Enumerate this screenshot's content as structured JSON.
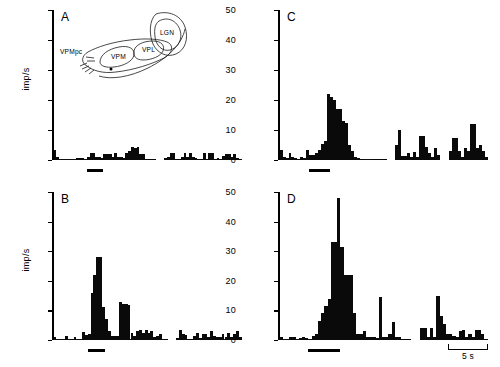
{
  "figure": {
    "axis_title": "imp/s",
    "yticks": [
      0,
      10,
      20,
      30,
      40,
      50
    ],
    "ylim": [
      0,
      50
    ],
    "scale_label": "5 s",
    "panel_labels": [
      "A",
      "B",
      "C",
      "D"
    ]
  },
  "inset": {
    "name": "thalamus-schematic",
    "labels": [
      {
        "text": "LGN"
      },
      {
        "text": "VPL"
      },
      {
        "text": "VPM"
      },
      {
        "text": "VPMpc"
      }
    ]
  },
  "chart_data": [
    {
      "type": "bar",
      "panel": "A",
      "title": "A",
      "xlabel": "",
      "ylabel": "imp/s",
      "ylim": [
        0,
        50
      ],
      "yticks": [
        0,
        10,
        20,
        30,
        40,
        50
      ],
      "bin_seconds": 0.25,
      "stimulus_bar": {
        "start_bin": 12,
        "end_bin": 18,
        "label": ""
      },
      "gaps": [
        [
          37,
          40
        ]
      ],
      "values": [
        3.2,
        1.0,
        0,
        0,
        0,
        0,
        0,
        0,
        0.7,
        0.7,
        0.6,
        0,
        1.0,
        2.2,
        2.2,
        1.0,
        1.0,
        0.7,
        2.0,
        2.0,
        2.0,
        1.0,
        2.2,
        1.0,
        1.0,
        0.6,
        2.3,
        3.0,
        4.2,
        4.0,
        4.2,
        2.0,
        2.0,
        0.5,
        0.3,
        0.3,
        0.2,
        0,
        0,
        0,
        0.6,
        1.0,
        2.3,
        2.2,
        0.4,
        0.3,
        1.0,
        2.2,
        1.0,
        2.3,
        1.0,
        0.6,
        0.5,
        0.4,
        2.5,
        0.5,
        2.4,
        2.4,
        0.5,
        0.6,
        0.5,
        1.2,
        2.0,
        2.0,
        1.0,
        2.0,
        0.6,
        0.4
      ]
    },
    {
      "type": "bar",
      "panel": "B",
      "title": "B",
      "xlabel": "",
      "ylabel": "imp/s",
      "ylim": [
        0,
        50
      ],
      "yticks": [
        0,
        10,
        20,
        30,
        40,
        50
      ],
      "bin_seconds": 0.25,
      "stimulus_bar": {
        "start_bin": 12,
        "end_bin": 18,
        "label": ""
      },
      "gaps": [
        [
          40,
          43
        ]
      ],
      "values": [
        1.0,
        0,
        0,
        0,
        1.2,
        0,
        0,
        1.0,
        0,
        0,
        2.8,
        1.8,
        2.0,
        16.0,
        22.0,
        28.0,
        28.0,
        11.0,
        7.0,
        3.0,
        1.5,
        1.3,
        1.2,
        12.8,
        12.0,
        12.0,
        11.8,
        2.5,
        1.5,
        3.0,
        3.4,
        2.5,
        3.5,
        2.5,
        3.0,
        1.0,
        1.2,
        2.0,
        0.5,
        0.5,
        0,
        0,
        0,
        0.6,
        3.5,
        2.0,
        1.8,
        0.3,
        0.3,
        1.4,
        2.3,
        0.6,
        2.0,
        2.0,
        1.0,
        3.2,
        1.2,
        1.0,
        1.0,
        2.0,
        1.0,
        2.3,
        1.0,
        2.0,
        3.0,
        1.0
      ]
    },
    {
      "type": "bar",
      "panel": "C",
      "title": "C",
      "xlabel": "",
      "ylabel": "imp/s",
      "ylim": [
        0,
        50
      ],
      "yticks": [
        0,
        10,
        20,
        30,
        40,
        50
      ],
      "bin_seconds": 0.25,
      "stimulus_bar": {
        "start_bin": 10,
        "end_bin": 17,
        "label": ""
      },
      "gaps": [
        [
          36,
          39
        ],
        [
          54,
          57
        ]
      ],
      "values": [
        3.2,
        1.0,
        0.8,
        2.3,
        1.0,
        0.6,
        0.4,
        1.0,
        0.8,
        3.2,
        1.8,
        1.8,
        2.2,
        3.2,
        5.5,
        6.5,
        22.0,
        21.0,
        20.0,
        17.0,
        17.0,
        13.0,
        12.5,
        5.0,
        3.0,
        1.0,
        0.6,
        0.4,
        0,
        0,
        0,
        0.4,
        0.5,
        0.3,
        0.3,
        0.3,
        0,
        0,
        0,
        5.0,
        10.0,
        1.5,
        1.2,
        2.2,
        1.0,
        2.8,
        1.0,
        8.0,
        8.0,
        4.5,
        2.2,
        1.0,
        4.0,
        1.8,
        0,
        0,
        0,
        3.0,
        7.5,
        7.5,
        3.0,
        1.0,
        4.0,
        3.0,
        12.0,
        12.0,
        4.0,
        5.0,
        3.0,
        1.0
      ]
    },
    {
      "type": "bar",
      "panel": "D",
      "title": "D",
      "xlabel": "",
      "ylabel": "imp/s",
      "ylim": [
        0,
        50
      ],
      "yticks": [
        0,
        10,
        20,
        30,
        40,
        50
      ],
      "bin_seconds": 0.25,
      "stimulus_bar": {
        "start_bin": 9,
        "end_bin": 19,
        "label": ""
      },
      "gaps": [
        [
          41,
          44
        ]
      ],
      "values": [
        1.0,
        0,
        0,
        1.0,
        1.0,
        0,
        0.8,
        1.0,
        0.6,
        0.5,
        1.5,
        2.2,
        6.5,
        9.0,
        11.5,
        14.0,
        33.0,
        33.0,
        48.0,
        31.5,
        22.0,
        22.0,
        22.0,
        9.0,
        2.0,
        2.0,
        3.0,
        1.0,
        1.0,
        1.0,
        0.6,
        14.5,
        1.0,
        1.0,
        2.0,
        6.0,
        1.0,
        1.0,
        0.5,
        0.4,
        0.2,
        0,
        0,
        0,
        4.0,
        4.0,
        1.0,
        4.0,
        1.0,
        15.0,
        8.0,
        5.5,
        2.0,
        2.0,
        1.5,
        1.0,
        3.0,
        3.5,
        1.0,
        2.0,
        1.0,
        3.5,
        3.5,
        2.0,
        0.5
      ]
    }
  ]
}
